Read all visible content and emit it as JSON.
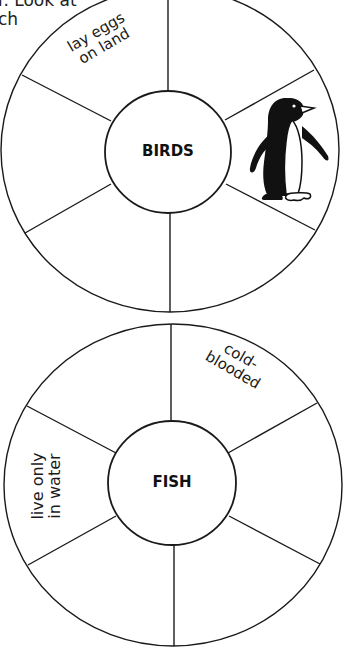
{
  "header": {
    "line1": "r. Look at",
    "line2": "ch"
  },
  "wheels": [
    {
      "name": "birds",
      "hub_label": "BIRDS",
      "sections": [
        {
          "position": "upper-left",
          "text": "lay eggs\non land"
        },
        {
          "position": "top-right",
          "text": ""
        },
        {
          "position": "right",
          "image": "penguin-icon"
        },
        {
          "position": "lower-right",
          "text": ""
        },
        {
          "position": "lower-left",
          "text": ""
        },
        {
          "position": "left",
          "text": ""
        }
      ]
    },
    {
      "name": "fish",
      "hub_label": "FISH",
      "sections": [
        {
          "position": "upper-left",
          "text": ""
        },
        {
          "position": "upper-right",
          "text": "cold-\nblooded"
        },
        {
          "position": "right",
          "text": ""
        },
        {
          "position": "lower-right",
          "text": ""
        },
        {
          "position": "lower-left",
          "text": ""
        },
        {
          "position": "left",
          "text": "live only\nin water"
        }
      ]
    }
  ],
  "colors": {
    "line": "#1a1a1a",
    "background": "#ffffff"
  }
}
